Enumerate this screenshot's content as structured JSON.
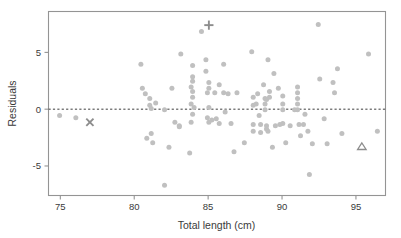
{
  "chart_data": {
    "type": "scatter",
    "title": "",
    "xlabel": "Total length (cm)",
    "ylabel": "Residuals",
    "xlim": [
      74.2,
      97.0
    ],
    "ylim": [
      -7.6,
      8.6
    ],
    "xticks": [
      75,
      80,
      85,
      90,
      95
    ],
    "xticklabels": [
      "75",
      "80",
      "85",
      "90",
      "95"
    ],
    "yticks": [
      5,
      0,
      -5
    ],
    "yticklabels": [
      "5",
      "0",
      "-5"
    ],
    "grid": false,
    "legend": "none",
    "reference_line": {
      "orientation": "horizontal",
      "y": 0,
      "style": "dashed"
    },
    "series": [
      {
        "name": "residuals",
        "marker": "circle",
        "color": "#c0c0c0",
        "points": [
          [
            74.95,
            -0.55
          ],
          [
            76.05,
            -0.75
          ],
          [
            80.45,
            3.95
          ],
          [
            80.55,
            1.85
          ],
          [
            80.75,
            1.35
          ],
          [
            81.05,
            0.95
          ],
          [
            81.05,
            0.35
          ],
          [
            81.15,
            0.05
          ],
          [
            80.85,
            -2.55
          ],
          [
            81.15,
            -2.15
          ],
          [
            81.25,
            -2.95
          ],
          [
            81.45,
            0.55
          ],
          [
            82.05,
            -0.05
          ],
          [
            82.05,
            -6.7
          ],
          [
            82.35,
            -3.35
          ],
          [
            82.55,
            1.85
          ],
          [
            82.75,
            -1.15
          ],
          [
            83.05,
            -1.45
          ],
          [
            83.15,
            4.85
          ],
          [
            83.05,
            -1.55
          ],
          [
            83.95,
            3.85
          ],
          [
            83.95,
            2.85
          ],
          [
            83.95,
            2.45
          ],
          [
            83.85,
            1.95
          ],
          [
            83.95,
            1.55
          ],
          [
            83.95,
            1.05
          ],
          [
            83.85,
            0.45
          ],
          [
            84.05,
            0.15
          ],
          [
            83.95,
            -0.45
          ],
          [
            83.85,
            -1.15
          ],
          [
            83.75,
            -3.85
          ],
          [
            84.55,
            6.85
          ],
          [
            84.85,
            4.35
          ],
          [
            84.85,
            3.35
          ],
          [
            85.05,
            2.35
          ],
          [
            85.05,
            1.85
          ],
          [
            84.95,
            1.45
          ],
          [
            85.05,
            0.15
          ],
          [
            84.95,
            -0.75
          ],
          [
            85.05,
            -1.15
          ],
          [
            85.25,
            -0.95
          ],
          [
            85.45,
            1.45
          ],
          [
            85.55,
            -0.85
          ],
          [
            85.75,
            2.15
          ],
          [
            85.75,
            -1.25
          ],
          [
            86.05,
            3.95
          ],
          [
            86.05,
            1.45
          ],
          [
            86.15,
            -0.25
          ],
          [
            86.35,
            1.35
          ],
          [
            86.55,
            -1.25
          ],
          [
            86.75,
            -3.75
          ],
          [
            86.95,
            1.45
          ],
          [
            87.45,
            -2.95
          ],
          [
            87.95,
            5.05
          ],
          [
            88.05,
            1.05
          ],
          [
            88.05,
            0.35
          ],
          [
            88.05,
            -1.35
          ],
          [
            88.05,
            -1.95
          ],
          [
            88.25,
            0.45
          ],
          [
            88.35,
            1.35
          ],
          [
            88.45,
            -0.55
          ],
          [
            88.55,
            -1.35
          ],
          [
            88.55,
            -2.05
          ],
          [
            88.75,
            2.15
          ],
          [
            88.85,
            0.95
          ],
          [
            88.85,
            0.45
          ],
          [
            88.85,
            -0.05
          ],
          [
            88.95,
            0.85
          ],
          [
            88.95,
            -1.45
          ],
          [
            88.95,
            -1.75
          ],
          [
            89.05,
            4.35
          ],
          [
            89.15,
            1.55
          ],
          [
            89.15,
            1.05
          ],
          [
            89.05,
            -1.95
          ],
          [
            89.35,
            -3.35
          ],
          [
            89.45,
            3.15
          ],
          [
            89.55,
            -1.45
          ],
          [
            89.75,
            1.85
          ],
          [
            89.85,
            -1.35
          ],
          [
            90.05,
            1.15
          ],
          [
            90.05,
            0.45
          ],
          [
            90.05,
            -0.05
          ],
          [
            90.05,
            -1.25
          ],
          [
            90.25,
            -2.95
          ],
          [
            90.55,
            -1.45
          ],
          [
            90.85,
            -0.05
          ],
          [
            91.05,
            1.95
          ],
          [
            91.05,
            1.45
          ],
          [
            91.05,
            0.95
          ],
          [
            91.05,
            0.45
          ],
          [
            91.05,
            -0.05
          ],
          [
            91.15,
            -1.35
          ],
          [
            91.25,
            -2.35
          ],
          [
            91.45,
            -1.35
          ],
          [
            91.55,
            -0.45
          ],
          [
            91.75,
            -1.95
          ],
          [
            91.85,
            -5.75
          ],
          [
            92.05,
            -3.05
          ],
          [
            92.45,
            7.45
          ],
          [
            92.55,
            2.65
          ],
          [
            92.85,
            -0.85
          ],
          [
            93.05,
            -3.05
          ],
          [
            93.45,
            2.35
          ],
          [
            93.55,
            1.45
          ],
          [
            93.75,
            3.55
          ],
          [
            94.05,
            -2.15
          ],
          [
            95.85,
            4.85
          ],
          [
            96.45,
            -1.95
          ]
        ]
      },
      {
        "name": "outlier-plus",
        "marker": "plus",
        "color": "#8d8d8d",
        "points": [
          [
            85.05,
            7.4
          ]
        ]
      },
      {
        "name": "outlier-cross",
        "marker": "x",
        "color": "#8d8d8d",
        "points": [
          [
            77.0,
            -1.15
          ]
        ]
      },
      {
        "name": "outlier-triangle",
        "marker": "triangle",
        "color": "#8d8d8d",
        "points": [
          [
            95.4,
            -3.3
          ]
        ]
      }
    ]
  },
  "axes": {
    "x_axis_label": "Total length (cm)",
    "y_axis_label": "Residuals"
  }
}
